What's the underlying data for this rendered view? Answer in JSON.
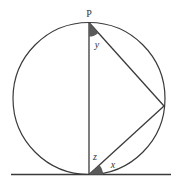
{
  "diagram": {
    "type": "circle-geometry",
    "labels": {
      "top_point": "P",
      "angle_top": "y",
      "angle_bottom_inner": "z",
      "angle_bottom_tangent": "x"
    },
    "colors": {
      "stroke": "#3a3a3a",
      "shaded_angle": "#5a5a5a",
      "background": "#ffffff"
    },
    "circle": {
      "cx": 89,
      "cy": 98.5,
      "r": 76
    },
    "points": {
      "P": [
        89,
        22.5
      ],
      "bottom": [
        89,
        174.5
      ],
      "right": [
        164,
        106
      ]
    },
    "tangent_line": {
      "x1": 11,
      "x2": 171,
      "y": 174.5
    }
  }
}
